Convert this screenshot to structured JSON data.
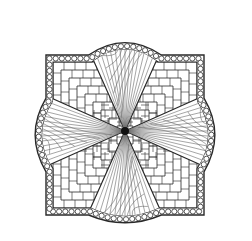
{
  "image": {
    "subject": "zentangle-style mandala line drawing",
    "width": 252,
    "height": 241,
    "colors": {
      "background": "#ffffff",
      "ink": "#2a2a2a",
      "fine_ink": "#6a6a6a",
      "center_dot": "#111111"
    },
    "center": [
      125,
      131
    ],
    "square": {
      "left": 46,
      "top": 55,
      "right": 204,
      "bottom": 215
    },
    "bulges": {
      "top": 39,
      "right": 218,
      "bottom": 225,
      "left": 32
    },
    "petals": 4,
    "border_pattern": "circles-in-band",
    "fill_pattern": "woven-basket-rectangles"
  }
}
